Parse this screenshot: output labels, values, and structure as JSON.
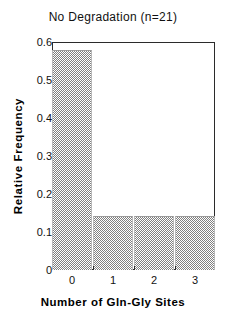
{
  "chart_data": {
    "type": "bar",
    "title": "No Degradation (n=21)",
    "xlabel": "Number of Gln-Gly Sites",
    "ylabel": "Relative Frequency",
    "categories": [
      "0",
      "1",
      "2",
      "3"
    ],
    "values": [
      0.58,
      0.143,
      0.143,
      0.143
    ],
    "ylim": [
      0,
      0.6
    ],
    "xlim": [
      -0.5,
      3.5
    ],
    "ytick_labels": [
      "0",
      "0.1",
      "0.2",
      "0.3",
      "0.4",
      "0.5",
      "0.6"
    ],
    "ytick_values": [
      0,
      0.1,
      0.2,
      0.3,
      0.4,
      0.5,
      0.6
    ],
    "xtick_labels": [
      "0",
      "1",
      "2",
      "3"
    ],
    "grid": false,
    "legend": false,
    "bar_fill": "#808080",
    "bar_pattern": "checkerboard-stipple",
    "axis_color": "#2b2b2b",
    "background": "#ffffff",
    "n": 21
  }
}
